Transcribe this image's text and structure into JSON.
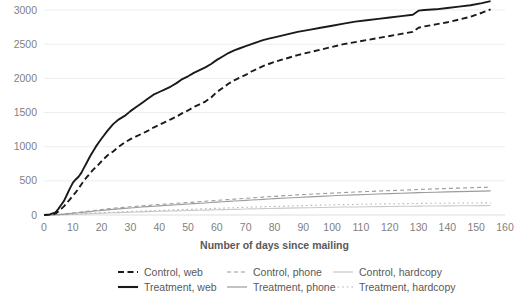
{
  "chart_data": {
    "type": "line",
    "title": "",
    "xlabel": "Number of days since mailing",
    "ylabel": "",
    "xlim": [
      0,
      160
    ],
    "ylim": [
      0,
      3000
    ],
    "grid": "horizontal",
    "legend_position": "bottom",
    "x_ticks": [
      0,
      10,
      20,
      30,
      40,
      50,
      60,
      70,
      80,
      90,
      100,
      110,
      120,
      130,
      140,
      150,
      160
    ],
    "y_ticks": [
      0,
      500,
      1000,
      1500,
      2000,
      2500,
      3000
    ],
    "x": [
      0,
      2,
      4,
      5,
      6,
      7,
      8,
      9,
      10,
      11,
      12,
      13,
      14,
      15,
      16,
      17,
      18,
      19,
      20,
      22,
      24,
      26,
      28,
      30,
      32,
      34,
      36,
      38,
      40,
      42,
      44,
      46,
      48,
      50,
      52,
      54,
      56,
      58,
      60,
      62,
      64,
      66,
      68,
      70,
      72,
      74,
      76,
      78,
      80,
      84,
      88,
      92,
      96,
      100,
      104,
      108,
      112,
      116,
      120,
      124,
      128,
      130,
      132,
      136,
      140,
      144,
      148,
      152,
      155
    ],
    "series": [
      {
        "name": "Treatment, web",
        "style": "solid",
        "color": "#1a1a1a",
        "width": 1.9,
        "values": [
          0,
          10,
          40,
          90,
          150,
          210,
          300,
          390,
          470,
          520,
          560,
          620,
          700,
          780,
          860,
          930,
          1000,
          1060,
          1120,
          1230,
          1330,
          1400,
          1450,
          1520,
          1580,
          1640,
          1700,
          1760,
          1800,
          1840,
          1880,
          1930,
          1990,
          2030,
          2080,
          2120,
          2160,
          2210,
          2270,
          2320,
          2370,
          2410,
          2440,
          2470,
          2500,
          2530,
          2560,
          2580,
          2600,
          2640,
          2680,
          2710,
          2740,
          2770,
          2800,
          2830,
          2850,
          2870,
          2890,
          2910,
          2930,
          2990,
          3000,
          3010,
          3030,
          3050,
          3070,
          3100,
          3130
        ]
      },
      {
        "name": "Control, web",
        "style": "dashed",
        "color": "#1a1a1a",
        "width": 1.9,
        "values": [
          0,
          5,
          20,
          50,
          90,
          130,
          180,
          230,
          280,
          330,
          390,
          450,
          510,
          560,
          610,
          660,
          700,
          740,
          790,
          870,
          930,
          1000,
          1060,
          1110,
          1150,
          1190,
          1230,
          1280,
          1320,
          1360,
          1400,
          1440,
          1490,
          1530,
          1580,
          1620,
          1660,
          1720,
          1800,
          1860,
          1920,
          1970,
          2010,
          2050,
          2100,
          2140,
          2180,
          2210,
          2240,
          2290,
          2340,
          2380,
          2420,
          2460,
          2500,
          2530,
          2560,
          2590,
          2620,
          2650,
          2680,
          2740,
          2760,
          2790,
          2820,
          2860,
          2900,
          2960,
          3010
        ]
      },
      {
        "name": "Control, phone",
        "style": "dashed-thin",
        "color": "#9c9c9c",
        "width": 1.1,
        "values": [
          0,
          2,
          5,
          8,
          12,
          16,
          20,
          25,
          30,
          35,
          40,
          45,
          50,
          55,
          60,
          65,
          70,
          75,
          80,
          90,
          98,
          106,
          113,
          120,
          127,
          134,
          140,
          147,
          153,
          159,
          165,
          171,
          177,
          183,
          189,
          195,
          201,
          207,
          214,
          220,
          226,
          232,
          238,
          244,
          250,
          256,
          262,
          268,
          273,
          284,
          294,
          303,
          312,
          320,
          328,
          336,
          343,
          350,
          357,
          363,
          369,
          374,
          377,
          383,
          389,
          394,
          399,
          404,
          408
        ]
      },
      {
        "name": "Treatment, phone",
        "style": "solid-thin",
        "color": "#9c9c9c",
        "width": 1.1,
        "values": [
          0,
          1,
          3,
          6,
          9,
          13,
          17,
          21,
          25,
          29,
          33,
          38,
          42,
          46,
          50,
          55,
          59,
          63,
          67,
          75,
          83,
          90,
          97,
          103,
          110,
          116,
          122,
          128,
          134,
          139,
          145,
          150,
          155,
          161,
          166,
          171,
          176,
          182,
          188,
          193,
          199,
          204,
          209,
          214,
          219,
          224,
          229,
          234,
          239,
          248,
          257,
          265,
          273,
          281,
          288,
          295,
          301,
          307,
          313,
          319,
          324,
          327,
          330,
          334,
          338,
          342,
          346,
          350,
          353
        ]
      },
      {
        "name": "Treatment, hardcopy",
        "style": "dotted",
        "color": "#b5b5b5",
        "width": 1.1,
        "values": [
          0,
          1,
          2,
          3,
          5,
          6,
          8,
          10,
          12,
          14,
          16,
          18,
          20,
          22,
          24,
          26,
          28,
          30,
          32,
          36,
          40,
          44,
          48,
          51,
          55,
          58,
          62,
          65,
          68,
          71,
          74,
          77,
          80,
          83,
          86,
          89,
          92,
          95,
          98,
          101,
          104,
          107,
          110,
          113,
          116,
          118,
          121,
          124,
          126,
          131,
          136,
          140,
          144,
          148,
          152,
          155,
          158,
          161,
          164,
          166,
          168,
          169,
          170,
          172,
          173,
          175,
          176,
          177,
          178
        ]
      },
      {
        "name": "Control, hardcopy",
        "style": "solid-light",
        "color": "#c9c9c9",
        "width": 1.1,
        "values": [
          0,
          0,
          1,
          2,
          3,
          4,
          6,
          7,
          9,
          10,
          12,
          14,
          16,
          17,
          19,
          21,
          22,
          24,
          26,
          29,
          32,
          35,
          38,
          41,
          43,
          46,
          49,
          51,
          54,
          56,
          59,
          61,
          63,
          66,
          68,
          70,
          72,
          75,
          77,
          79,
          81,
          83,
          85,
          87,
          89,
          91,
          93,
          95,
          97,
          100,
          104,
          107,
          110,
          113,
          116,
          118,
          121,
          123,
          125,
          127,
          129,
          130,
          131,
          132,
          133,
          135,
          136,
          137,
          138
        ]
      }
    ],
    "legend": [
      {
        "label": "Control, web",
        "style": "dashed",
        "color": "#1a1a1a"
      },
      {
        "label": "Control, phone",
        "style": "dashed-thin",
        "color": "#9c9c9c"
      },
      {
        "label": "Control, hardcopy",
        "style": "solid-light",
        "color": "#c9c9c9"
      },
      {
        "label": "Treatment, web",
        "style": "solid",
        "color": "#1a1a1a"
      },
      {
        "label": "Treatment, phone",
        "style": "solid-thin",
        "color": "#9c9c9c"
      },
      {
        "label": "Treatment, hardcopy",
        "style": "dotted",
        "color": "#b5b5b5"
      }
    ]
  }
}
